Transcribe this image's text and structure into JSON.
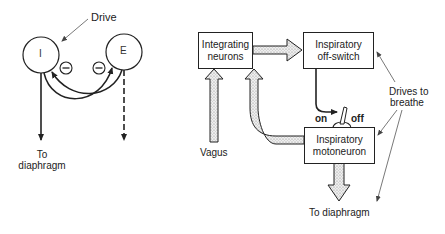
{
  "left_diagram": {
    "drive_label": "Drive",
    "node_i": "I",
    "node_e": "E",
    "inhibit_symbol": "−",
    "output_label_line1": "To",
    "output_label_line2": "diaphragm"
  },
  "right_diagram": {
    "integrating_box": {
      "line1": "Integrating",
      "line2": "neurons"
    },
    "offswitch_box": {
      "line1": "Inspiratory",
      "line2": "off-switch"
    },
    "motoneuron_box": {
      "line1": "Inspiratory",
      "line2": "motoneuron"
    },
    "switch_on": "on",
    "switch_off": "off",
    "vagus_label": "Vagus",
    "drives_label_line1": "Drives to",
    "drives_label_line2": "breathe",
    "output_label": "To diaphragm"
  },
  "colors": {
    "stroke": "#222222",
    "stipple": "#d8d8d8",
    "background": "#ffffff"
  }
}
